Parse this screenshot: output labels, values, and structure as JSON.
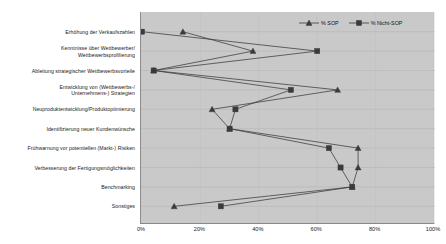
{
  "chart_data": {
    "type": "line",
    "title": "",
    "subtitle": "",
    "xlabel": "",
    "ylabel": "",
    "orientation": "horizontal",
    "xlim": [
      0,
      100
    ],
    "xticks": [
      "0%",
      "20%",
      "40%",
      "60%",
      "80%",
      "100%"
    ],
    "xtick_values": [
      0,
      20,
      40,
      60,
      80,
      100
    ],
    "grid": true,
    "legend_position": "top-right",
    "plot_background": "#c9c9c9",
    "series_color": "#3a3a3a",
    "categories": [
      "Erhöhung der Verkaufszahlen",
      "Kenntnisse über Wettbewerber/\nWettbewerbsprofilierung",
      "Ableitung strategischer Wettbewerbsvorteile",
      "Entwicklung von (Wettbewerbs-/\nUnternehmens-) Strategien",
      "Neuproduktentwicklung/Produktoptimierung",
      "Identifizierung neuer Kundenwünsche",
      "Frühwarnung vor potentiellen (Markt-) Risiken",
      "Verbesserung der Fertigungsmöglichkeiten",
      "Benchmarking",
      "Sonstiges"
    ],
    "series": [
      {
        "name": "% SOP",
        "marker": "triangle",
        "values": [
          14,
          38,
          4,
          67,
          24,
          30,
          74,
          74,
          72,
          11
        ]
      },
      {
        "name": "% Nicht-SOP",
        "marker": "square",
        "values": [
          0,
          60,
          4,
          51,
          32,
          30,
          64,
          68,
          72,
          27
        ]
      }
    ]
  },
  "legend": {
    "items": [
      {
        "label": "% SOP",
        "marker": "triangle"
      },
      {
        "label": "% Nicht-SOP",
        "marker": "square"
      }
    ]
  }
}
